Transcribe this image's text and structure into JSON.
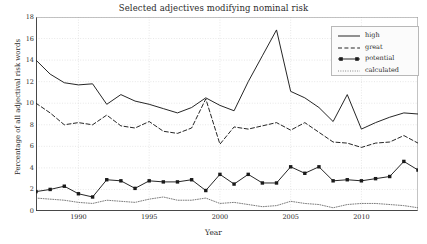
{
  "chart_data": {
    "type": "line",
    "title": "Selected adjectives modifying nominal risk",
    "xlabel": "Year",
    "ylabel": "Percentage of all adjectival risk words",
    "xlim": [
      1987,
      2014
    ],
    "ylim": [
      0,
      18
    ],
    "xticks": [
      1990,
      1995,
      2000,
      2005,
      2010
    ],
    "yticks": [
      0,
      2,
      4,
      6,
      8,
      10,
      12,
      14,
      16,
      18
    ],
    "grid": true,
    "legend_position": "upper right",
    "x": [
      1987,
      1988,
      1989,
      1990,
      1991,
      1992,
      1993,
      1994,
      1995,
      1996,
      1997,
      1998,
      1999,
      2000,
      2001,
      2002,
      2003,
      2004,
      2005,
      2006,
      2007,
      2008,
      2009,
      2010,
      2011,
      2012,
      2013,
      2014
    ],
    "series": [
      {
        "name": "high",
        "style": "solid",
        "marker": "none",
        "color": "#1a1a1a",
        "values": [
          14.0,
          12.7,
          11.9,
          11.7,
          11.8,
          9.9,
          10.8,
          10.2,
          9.9,
          9.5,
          9.1,
          9.6,
          10.5,
          9.8,
          9.3,
          12.0,
          14.4,
          16.8,
          11.1,
          10.5,
          9.6,
          8.3,
          10.8,
          7.6,
          8.2,
          8.7,
          9.1,
          9.0
        ]
      },
      {
        "name": "great",
        "style": "dashed",
        "marker": "none",
        "color": "#1a1a1a",
        "values": [
          10.0,
          9.1,
          8.0,
          8.2,
          8.0,
          8.9,
          7.9,
          7.7,
          8.3,
          7.4,
          7.2,
          7.7,
          10.4,
          6.2,
          7.8,
          7.6,
          7.9,
          8.2,
          7.5,
          8.2,
          7.3,
          6.4,
          6.3,
          5.9,
          6.3,
          6.4,
          7.0,
          6.3
        ]
      },
      {
        "name": "potential",
        "style": "solid",
        "marker": "square",
        "color": "#1a1a1a",
        "values": [
          1.8,
          2.0,
          2.3,
          1.6,
          1.3,
          2.9,
          2.8,
          2.1,
          2.8,
          2.7,
          2.7,
          2.9,
          1.9,
          3.4,
          2.5,
          3.4,
          2.6,
          2.6,
          4.1,
          3.5,
          4.1,
          2.8,
          2.9,
          2.8,
          3.0,
          3.2,
          4.6,
          3.8
        ]
      },
      {
        "name": "calculated",
        "style": "dotted",
        "marker": "none",
        "color": "#5a5a5a",
        "values": [
          1.2,
          1.1,
          1.0,
          0.8,
          0.7,
          1.0,
          0.9,
          0.8,
          1.1,
          1.3,
          1.0,
          1.0,
          1.2,
          0.7,
          0.8,
          0.6,
          0.4,
          0.5,
          0.9,
          0.7,
          0.6,
          0.3,
          0.6,
          0.7,
          0.7,
          0.6,
          0.5,
          0.3
        ]
      }
    ]
  },
  "legend": {
    "items": [
      {
        "label": "high"
      },
      {
        "label": "great"
      },
      {
        "label": "potential"
      },
      {
        "label": "calculated"
      }
    ]
  },
  "colors": {
    "axis": "#333333",
    "grid": "#cfcfcf",
    "background": "#ffffff"
  }
}
